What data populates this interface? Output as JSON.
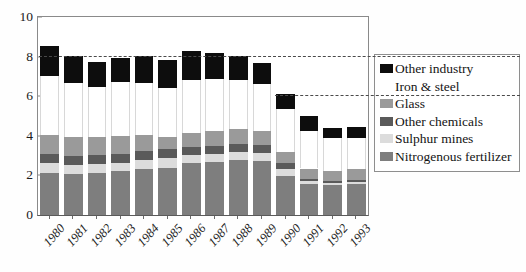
{
  "chart_data": {
    "type": "bar",
    "subtype": "stacked-vertical",
    "title": "",
    "xlabel": "",
    "ylabel": "",
    "ylim": [
      0,
      10
    ],
    "yticks": [
      0,
      2,
      4,
      6,
      8,
      10
    ],
    "ytick_labels": [
      "0",
      "2",
      "4",
      "6",
      "8",
      "10"
    ],
    "grid": false,
    "legend_position": "right",
    "reference_lines": [
      {
        "value": 8,
        "style": "dashed",
        "x_from_category": "1980",
        "x_to_edge": "legend"
      },
      {
        "value": 6,
        "style": "dashed",
        "x_from_category": "1990",
        "x_to_edge": "legend"
      }
    ],
    "categories": [
      "1980",
      "1981",
      "1982",
      "1983",
      "1984",
      "1985",
      "1986",
      "1987",
      "1988",
      "1989",
      "1990",
      "1991",
      "1992",
      "1993"
    ],
    "series": [
      {
        "name": "Nitrogenous fertilizer",
        "color": "#7e7e7e",
        "values": [
          2.1,
          2.05,
          2.1,
          2.2,
          2.3,
          2.35,
          2.65,
          2.7,
          2.8,
          2.75,
          1.95,
          1.55,
          1.5,
          1.55
        ]
      },
      {
        "name": "Sulphur mines",
        "color": "#dcdcdc",
        "values": [
          0.55,
          0.5,
          0.5,
          0.45,
          0.5,
          0.55,
          0.4,
          0.4,
          0.4,
          0.4,
          0.35,
          0.15,
          0.12,
          0.1
        ]
      },
      {
        "name": "Other chemicals",
        "color": "#5a5a5a",
        "values": [
          0.45,
          0.45,
          0.45,
          0.45,
          0.45,
          0.45,
          0.4,
          0.4,
          0.4,
          0.4,
          0.35,
          0.1,
          0.1,
          0.1
        ]
      },
      {
        "name": "Glass",
        "color": "#9a9a9a",
        "values": [
          0.95,
          0.95,
          0.9,
          0.9,
          0.8,
          0.6,
          0.7,
          0.75,
          0.75,
          0.7,
          0.55,
          0.55,
          0.5,
          0.55
        ]
      },
      {
        "name": "Iron & steel",
        "color": "#ffffff",
        "values": [
          2.95,
          2.7,
          2.5,
          2.7,
          2.6,
          2.45,
          2.65,
          2.6,
          2.45,
          2.35,
          2.15,
          1.9,
          1.65,
          1.6
        ]
      },
      {
        "name": "Other industry",
        "color": "#0d0d0d",
        "values": [
          1.55,
          1.4,
          1.3,
          1.25,
          1.4,
          1.45,
          1.5,
          1.35,
          1.25,
          1.1,
          0.75,
          0.75,
          0.55,
          0.55
        ]
      }
    ],
    "totals": [
      8.55,
      8.05,
      7.75,
      7.95,
      8.05,
      7.85,
      8.3,
      8.2,
      8.05,
      7.7,
      6.1,
      5.0,
      4.42,
      4.45
    ]
  },
  "legend": {
    "items": [
      {
        "label": "Other industry",
        "color": "#0d0d0d"
      },
      {
        "label": "Iron  & steel",
        "color": "#ffffff"
      },
      {
        "label": "Glass",
        "color": "#9a9a9a"
      },
      {
        "label": "Other chemicals",
        "color": "#5a5a5a"
      },
      {
        "label": "Sulphur mines",
        "color": "#dcdcdc"
      },
      {
        "label": "Nitrogenous fertilizer",
        "color": "#7e7e7e"
      }
    ]
  },
  "axes": {
    "y_tick_labels": [
      "10",
      "8",
      "6",
      "4",
      "2",
      "0"
    ],
    "x_tick_labels": [
      "1980",
      "1981",
      "1982",
      "1983",
      "1984",
      "1985",
      "1986",
      "1987",
      "1988",
      "1989",
      "1990",
      "1991",
      "1992",
      "1993"
    ]
  },
  "colors": {
    "frame": "#8a8a8a",
    "text": "#1a1a1a",
    "plot_background": "#ffffff",
    "page_background": "#fefefe",
    "reference_line": "#4a4a4a"
  }
}
